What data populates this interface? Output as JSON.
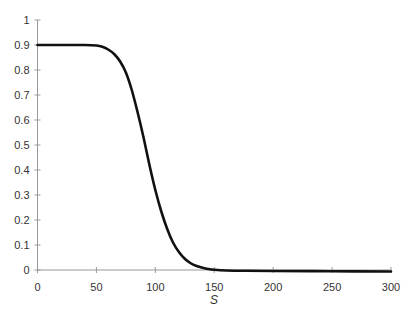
{
  "chart_data": {
    "type": "line",
    "title": "",
    "xlabel": "S",
    "ylabel": "",
    "xlim": [
      0,
      300
    ],
    "ylim": [
      0,
      1
    ],
    "grid": false,
    "legend": null,
    "x_ticks": [
      0,
      50,
      100,
      150,
      200,
      250,
      300
    ],
    "y_ticks": [
      0,
      0.1,
      0.2,
      0.3,
      0.4,
      0.5,
      0.6,
      0.7,
      0.8,
      0.9,
      1
    ],
    "y_tick_labels": [
      "0",
      "0.1",
      "0.2",
      "0.3",
      "0.4",
      "0.5",
      "0.6",
      "0.7",
      "0.8",
      "0.9",
      "1"
    ],
    "series": [
      {
        "name": "curve",
        "color": "#111111",
        "x": [
          0,
          20,
          40,
          50,
          55,
          60,
          65,
          70,
          75,
          80,
          85,
          90,
          95,
          100,
          105,
          110,
          115,
          120,
          125,
          130,
          135,
          140,
          145,
          150,
          160,
          175,
          200,
          250,
          300
        ],
        "y": [
          0.9,
          0.9,
          0.9,
          0.898,
          0.893,
          0.882,
          0.864,
          0.835,
          0.79,
          0.72,
          0.63,
          0.53,
          0.42,
          0.32,
          0.235,
          0.165,
          0.11,
          0.072,
          0.045,
          0.027,
          0.016,
          0.009,
          0.004,
          0.001,
          -0.002,
          -0.003,
          -0.004,
          -0.005,
          -0.006
        ]
      }
    ]
  }
}
